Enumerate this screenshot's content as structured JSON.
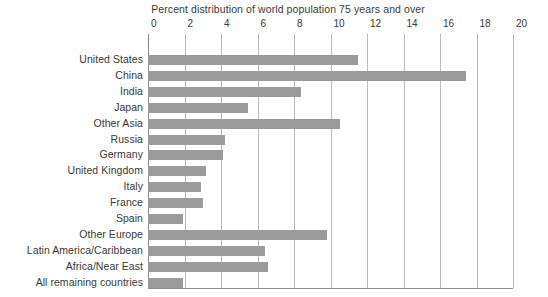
{
  "chart_data": {
    "type": "bar",
    "orientation": "horizontal",
    "title": "Percent distribution of world population 75 years and over",
    "xlabel": "",
    "ylabel": "",
    "xlim": [
      0,
      20
    ],
    "xticks": [
      0,
      2,
      4,
      6,
      8,
      10,
      12,
      14,
      16,
      18,
      20
    ],
    "grid": true,
    "legend": "none",
    "bar_color": "#9b9b9b",
    "gridline_color": "#b9b9b9",
    "axis_color": "#8c8c8c",
    "background_color": "#ffffff",
    "categories": [
      "United States",
      "China",
      "India",
      "Japan",
      "Other Asia",
      "Russia",
      "Germany",
      "United Kingdom",
      "Italy",
      "France",
      "Spain",
      "Other Europe",
      "Latin America/Caribbean",
      "Africa/Near East",
      "All remaining countries"
    ],
    "values": [
      11.5,
      17.4,
      8.4,
      5.5,
      10.5,
      4.2,
      4.1,
      3.2,
      2.9,
      3.0,
      1.9,
      9.8,
      6.4,
      6.6,
      1.9
    ]
  }
}
